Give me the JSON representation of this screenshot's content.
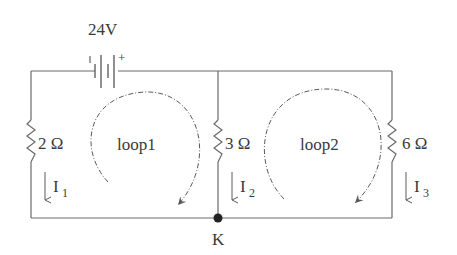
{
  "circuit": {
    "source": {
      "label": "24V",
      "plus": "+",
      "minus": "-"
    },
    "resistors": [
      {
        "id": "R1",
        "label": "2 Ω",
        "branch": "left"
      },
      {
        "id": "R2",
        "label": "3 Ω",
        "branch": "middle"
      },
      {
        "id": "R3",
        "label": "6 Ω",
        "branch": "right"
      }
    ],
    "currents": [
      {
        "id": "I1",
        "main": "I",
        "sub": "1",
        "direction": "down"
      },
      {
        "id": "I2",
        "main": "I",
        "sub": "2",
        "direction": "down"
      },
      {
        "id": "I3",
        "main": "I",
        "sub": "3",
        "direction": "down"
      }
    ],
    "loops": [
      {
        "id": "loop1",
        "label": "loop1",
        "direction": "clockwise"
      },
      {
        "id": "loop2",
        "label": "loop2",
        "direction": "clockwise"
      }
    ],
    "node": {
      "label": "K"
    }
  }
}
